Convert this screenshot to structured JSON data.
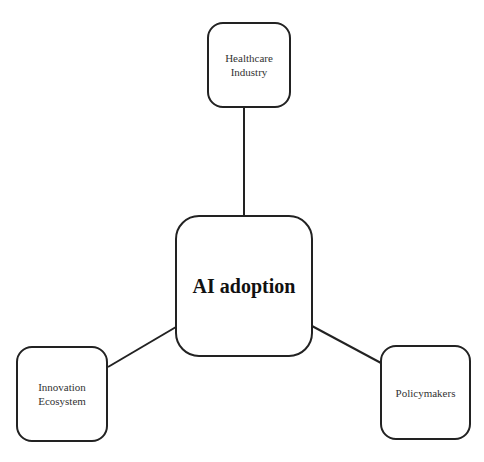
{
  "diagram": {
    "center": {
      "label": "AI adoption"
    },
    "nodes": [
      {
        "id": "healthcare",
        "label": "Healthcare\nIndustry"
      },
      {
        "id": "innovation",
        "label": "Innovation\nEcosystem"
      },
      {
        "id": "policymakers",
        "label": "Policymakers"
      }
    ],
    "edges": [
      {
        "from": "center",
        "to": "healthcare"
      },
      {
        "from": "center",
        "to": "innovation"
      },
      {
        "from": "center",
        "to": "policymakers"
      }
    ],
    "colors": {
      "stroke": "#222222",
      "background": "#ffffff"
    }
  }
}
